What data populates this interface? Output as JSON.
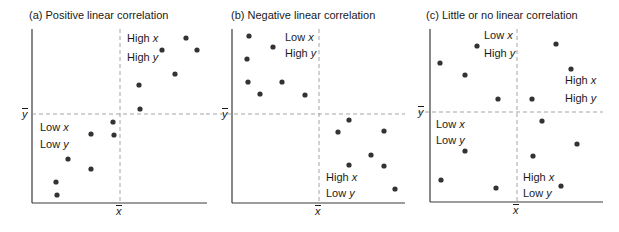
{
  "chart_data": [
    {
      "type": "scatter",
      "title": "(a)  Positive linear correlation",
      "xlabel": "x̄",
      "ylabel": "ȳ",
      "grid": false,
      "frame": {
        "left": 32,
        "bottom": 203,
        "right": 207,
        "top": 29,
        "xbar": 120,
        "ybar": 114,
        "ybar_line_start": 32
      },
      "title_pos": {
        "x": 29,
        "y": 9
      },
      "points": [
        [
          186,
          38
        ],
        [
          162,
          50
        ],
        [
          197,
          50
        ],
        [
          175,
          74
        ],
        [
          139,
          85
        ],
        [
          140,
          109
        ],
        [
          113,
          122
        ],
        [
          91,
          134
        ],
        [
          114,
          135
        ],
        [
          68,
          159
        ],
        [
          91,
          169
        ],
        [
          56,
          182
        ],
        [
          57,
          195
        ]
      ],
      "quadrant_labels": [
        {
          "lines": [
            "High ",
            "x"
          ],
          "x": 127,
          "y": 32
        },
        {
          "lines": [
            "High ",
            "y"
          ],
          "x": 127,
          "y": 51
        },
        {
          "lines": [
            "Low ",
            "x"
          ],
          "x": 40,
          "y": 121
        },
        {
          "lines": [
            "Low ",
            "y"
          ],
          "x": 40,
          "y": 138
        }
      ],
      "xbar_label_pos": {
        "x": 116,
        "y": 206
      },
      "ybar_label_pos": {
        "x": 22,
        "y": 109
      }
    },
    {
      "type": "scatter",
      "title": "(b)  Negative linear correlation",
      "xlabel": "x̄",
      "ylabel": "ȳ",
      "grid": false,
      "frame": {
        "left": 232,
        "bottom": 203,
        "right": 405,
        "top": 29,
        "xbar": 319,
        "ybar": 114,
        "ybar_line_start": 206
      },
      "title_pos": {
        "x": 231,
        "y": 9
      },
      "points": [
        [
          249,
          36
        ],
        [
          273,
          47
        ],
        [
          247,
          59
        ],
        [
          248,
          82
        ],
        [
          282,
          82
        ],
        [
          260,
          94
        ],
        [
          305,
          95
        ],
        [
          349,
          120
        ],
        [
          338,
          132
        ],
        [
          384,
          131
        ],
        [
          371,
          155
        ],
        [
          349,
          165
        ],
        [
          384,
          166
        ],
        [
          395,
          189
        ]
      ],
      "quadrant_labels": [
        {
          "lines": [
            "Low ",
            "x"
          ],
          "x": 285,
          "y": 31
        },
        {
          "lines": [
            "High ",
            "y"
          ],
          "x": 285,
          "y": 47
        },
        {
          "lines": [
            "High ",
            "x"
          ],
          "x": 326,
          "y": 171
        },
        {
          "lines": [
            "Low ",
            "y"
          ],
          "x": 326,
          "y": 187
        }
      ],
      "xbar_label_pos": {
        "x": 315,
        "y": 206
      },
      "ybar_label_pos": {
        "x": 222,
        "y": 109
      }
    },
    {
      "type": "scatter",
      "title": "(c)  Little or no linear correlation",
      "xlabel": "x̄",
      "ylabel": "ȳ",
      "grid": false,
      "frame": {
        "left": 430,
        "bottom": 202,
        "right": 603,
        "top": 29,
        "xbar": 517,
        "ybar": 112,
        "ybar_line_start": 418
      },
      "title_pos": {
        "x": 426,
        "y": 9
      },
      "points": [
        [
          477,
          46
        ],
        [
          556,
          44
        ],
        [
          440,
          63
        ],
        [
          571,
          69
        ],
        [
          465,
          75
        ],
        [
          498,
          99
        ],
        [
          532,
          99
        ],
        [
          542,
          121
        ],
        [
          577,
          144
        ],
        [
          465,
          151
        ],
        [
          533,
          156
        ],
        [
          441,
          180
        ],
        [
          561,
          186
        ],
        [
          496,
          188
        ]
      ],
      "quadrant_labels": [
        {
          "lines": [
            "Low ",
            "x"
          ],
          "x": 484,
          "y": 29
        },
        {
          "lines": [
            "High ",
            "y"
          ],
          "x": 484,
          "y": 47
        },
        {
          "lines": [
            "High ",
            "x"
          ],
          "x": 565,
          "y": 74
        },
        {
          "lines": [
            "High ",
            "y"
          ],
          "x": 565,
          "y": 92
        },
        {
          "lines": [
            "Low ",
            "x"
          ],
          "x": 436,
          "y": 118
        },
        {
          "lines": [
            "Low ",
            "y"
          ],
          "x": 436,
          "y": 134
        },
        {
          "lines": [
            "High ",
            "x"
          ],
          "x": 523,
          "y": 171
        },
        {
          "lines": [
            "Low ",
            "y"
          ],
          "x": 523,
          "y": 187
        }
      ],
      "xbar_label_pos": {
        "x": 513,
        "y": 205
      },
      "ybar_label_pos": {
        "x": 418,
        "y": 107
      }
    }
  ],
  "colors": {
    "axis": "#3a3a3a",
    "dashed": "#9a9a9a",
    "point": "#333333",
    "text": "#1a1a1a"
  }
}
